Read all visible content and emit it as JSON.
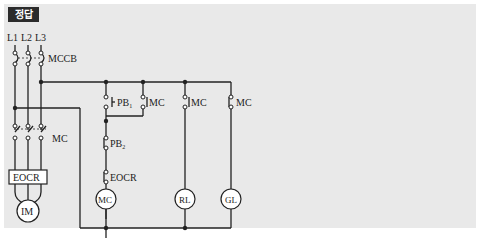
{
  "badge": {
    "label": "정답"
  },
  "colors": {
    "wire": "#222222",
    "panel": "#e9e9e9",
    "badge_bg": "#2b2b2b",
    "badge_fg": "#ffffff",
    "component_fill": "#ffffff"
  },
  "power_circuit": {
    "lines": [
      "L1",
      "L2",
      "L3"
    ],
    "breaker": "MCCB",
    "main_contactor": "MC",
    "overload_relay": "EOCR",
    "motor": "IM"
  },
  "control_circuit": {
    "start_button": {
      "label": "PB",
      "subscript": "1",
      "type": "NO"
    },
    "self_hold_contact": {
      "label": "MC",
      "type": "NO"
    },
    "stop_button": {
      "label": "PB",
      "subscript": "2",
      "type": "NC"
    },
    "overload_contact": {
      "label": "EOCR",
      "type": "NC"
    },
    "coil": "MC",
    "run_lamp_contact": {
      "label": "MC",
      "type": "NO"
    },
    "stop_lamp_contact": {
      "label": "MC",
      "type": "NC"
    },
    "run_lamp": "RL",
    "stop_lamp": "GL"
  }
}
